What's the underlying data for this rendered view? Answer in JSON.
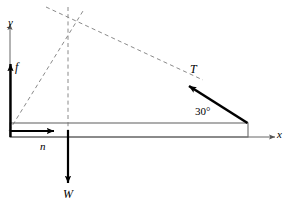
{
  "figure": {
    "type": "free-body-diagram",
    "axes": {
      "x_label": "x",
      "y_label": "y",
      "origin": [
        10,
        137
      ]
    },
    "vectors": [
      {
        "id": "friction",
        "label": "f",
        "direction": "up",
        "from": [
          10,
          137
        ],
        "to": [
          10,
          62
        ]
      },
      {
        "id": "normal",
        "label": "n",
        "direction": "right",
        "from": [
          10,
          131
        ],
        "to": [
          57,
          131
        ]
      },
      {
        "id": "weight",
        "label": "W",
        "direction": "down",
        "from": [
          68,
          130
        ],
        "to": [
          68,
          185
        ]
      },
      {
        "id": "tension",
        "label": "T",
        "direction": "up-left",
        "from": [
          248,
          123
        ],
        "to": [
          186,
          84
        ]
      }
    ],
    "angles": [
      {
        "id": "tension-angle",
        "label": "30°",
        "value": 30,
        "unit": "degrees"
      }
    ],
    "beam": {
      "left": 10,
      "right": 248,
      "top": 123,
      "bottom": 137
    },
    "construction_lines": {
      "intersection_point": [
        68,
        22
      ],
      "lines": [
        {
          "id": "vertical-dashed",
          "from": [
            68,
            8
          ],
          "to": [
            68,
            137
          ]
        },
        {
          "id": "friction-dashed",
          "from": [
            10,
            130
          ],
          "to": [
            82,
            12
          ]
        },
        {
          "id": "tension-dashed",
          "from": [
            48,
            8
          ],
          "to": [
            200,
            79
          ]
        }
      ]
    },
    "colors": {
      "stroke": "#000000",
      "axis": "#555555",
      "dashed": "#8a8a8a",
      "background": "#ffffff"
    }
  }
}
